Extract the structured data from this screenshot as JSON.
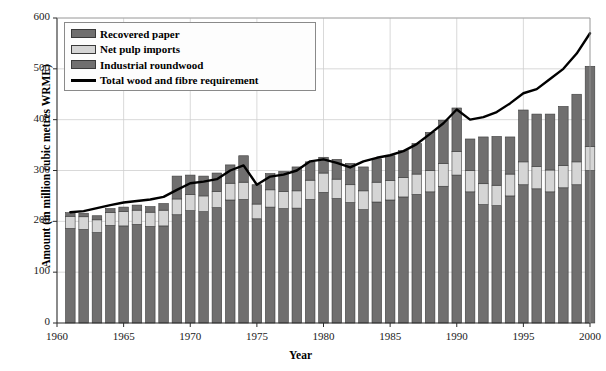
{
  "chart_data": {
    "type": "bar",
    "subtype": "stacked-bar-with-line-overlay",
    "title": "",
    "xlabel": "Year",
    "ylabel": "Amount (in million cubic metres WRME)",
    "xlim": [
      1960,
      2000
    ],
    "ylim": [
      0,
      600
    ],
    "ytick_labels": [
      "0",
      "100",
      "200",
      "300",
      "400",
      "500",
      "600"
    ],
    "ytick_values": [
      0,
      100,
      200,
      300,
      400,
      500,
      600
    ],
    "xtick_labels": [
      "1960",
      "1965",
      "1970",
      "1975",
      "1980",
      "1985",
      "1990",
      "1995",
      "2000"
    ],
    "xtick_values": [
      1960,
      1965,
      1970,
      1975,
      1980,
      1985,
      1990,
      1995,
      2000
    ],
    "grid": "horizontal-and-vertical-light",
    "legend_position": "top-left-inside",
    "stack_order_bottom_to_top": [
      "Industrial roundwood",
      "Net pulp imports",
      "Recovered paper"
    ],
    "categories": [
      1961,
      1962,
      1963,
      1964,
      1965,
      1966,
      1967,
      1968,
      1969,
      1970,
      1971,
      1972,
      1973,
      1974,
      1975,
      1976,
      1977,
      1978,
      1979,
      1980,
      1981,
      1982,
      1983,
      1984,
      1985,
      1986,
      1987,
      1988,
      1989,
      1990,
      1991,
      1992,
      1993,
      1994,
      1995,
      1996,
      1997,
      1998,
      1999,
      2000
    ],
    "series": [
      {
        "name": "Industrial roundwood",
        "color": "#706f6f",
        "values": [
          186,
          184,
          178,
          192,
          191,
          194,
          190,
          191,
          213,
          221,
          219,
          227,
          242,
          243,
          205,
          228,
          225,
          226,
          243,
          257,
          245,
          237,
          223,
          238,
          242,
          248,
          253,
          258,
          269,
          291,
          258,
          233,
          231,
          250,
          272,
          264,
          258,
          266,
          272,
          300
        ]
      },
      {
        "name": "Net pulp imports",
        "color": "#d5d5d5",
        "values": [
          24,
          25,
          25,
          25,
          28,
          28,
          28,
          31,
          31,
          32,
          31,
          32,
          33,
          34,
          29,
          34,
          34,
          34,
          38,
          38,
          38,
          35,
          37,
          39,
          38,
          38,
          40,
          42,
          45,
          46,
          42,
          41,
          40,
          43,
          45,
          44,
          43,
          44,
          45,
          47
        ]
      },
      {
        "name": "Recovered paper",
        "color": "#706f6f",
        "values": [
          7,
          7,
          8,
          8,
          9,
          10,
          11,
          13,
          45,
          38,
          39,
          36,
          36,
          52,
          38,
          32,
          39,
          47,
          36,
          31,
          39,
          42,
          47,
          46,
          49,
          53,
          60,
          75,
          85,
          86,
          62,
          92,
          96,
          73,
          102,
          103,
          110,
          116,
          133,
          158
        ]
      }
    ],
    "line_series": {
      "name": "Total wood and fibre requirement",
      "color": "#000000",
      "x": [
        1961,
        1962,
        1963,
        1964,
        1965,
        1966,
        1967,
        1968,
        1969,
        1970,
        1971,
        1972,
        1973,
        1974,
        1975,
        1976,
        1977,
        1978,
        1979,
        1980,
        1981,
        1982,
        1983,
        1984,
        1985,
        1986,
        1987,
        1988,
        1989,
        1990,
        1991,
        1992,
        1993,
        1994,
        1995,
        1996,
        1997,
        1998,
        1999,
        2000
      ],
      "values": [
        218,
        220,
        226,
        232,
        237,
        240,
        243,
        248,
        262,
        275,
        278,
        283,
        300,
        310,
        272,
        288,
        292,
        300,
        318,
        322,
        315,
        306,
        318,
        325,
        330,
        338,
        352,
        372,
        393,
        420,
        400,
        405,
        415,
        432,
        452,
        460,
        480,
        500,
        530,
        570
      ]
    },
    "legend": [
      {
        "label": "Recovered paper",
        "type": "swatch",
        "color": "#706f6f"
      },
      {
        "label": "Net pulp imports",
        "type": "swatch",
        "color": "#d5d5d5"
      },
      {
        "label": "Industrial roundwood",
        "type": "swatch",
        "color": "#706f6f"
      },
      {
        "label": "Total wood and fibre requirement",
        "type": "line",
        "color": "#000000"
      }
    ]
  }
}
